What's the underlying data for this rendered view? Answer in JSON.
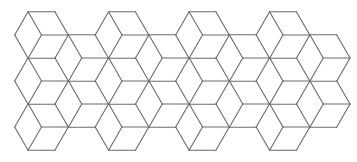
{
  "figure": {
    "type": "tumbling-blocks-tiling",
    "stroke_color": "#6a6a6a",
    "background": "#ffffff",
    "edge_length": 26.8,
    "row_height": 23.2,
    "origin_x": 15,
    "origin_y": 12,
    "cube_columns_top": [
      41.5,
      122,
      202.5,
      283
    ],
    "cube_rows_y": [
      35,
      81,
      127
    ],
    "mid_columns": [
      81.75,
      162.25,
      242.75,
      323.25
    ],
    "mid_rows_y": [
      58,
      104
    ]
  }
}
